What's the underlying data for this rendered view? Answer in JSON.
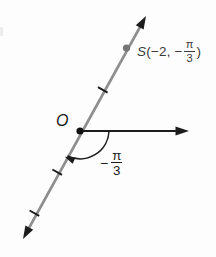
{
  "figure": {
    "type": "polar-coordinate-diagram",
    "colors": {
      "line_gray": "#8e8e8e",
      "axis_black": "#1c1c1c",
      "point_gray": "#757575",
      "text_dark": "#2f2f2f"
    },
    "labels": {
      "origin": "O",
      "point": {
        "name": "S",
        "open": "(−2, −",
        "frac_num": "π",
        "frac_den": "3",
        "close": ")"
      },
      "angle": {
        "sign": "−",
        "frac_num": "π",
        "frac_den": "3"
      }
    },
    "diagram_data": {
      "point_S_polar": "(-2, -π/3)",
      "angle_marked": "-π/3",
      "tick_marks_on_line": 3,
      "point_S_units_from_origin": 2
    }
  }
}
